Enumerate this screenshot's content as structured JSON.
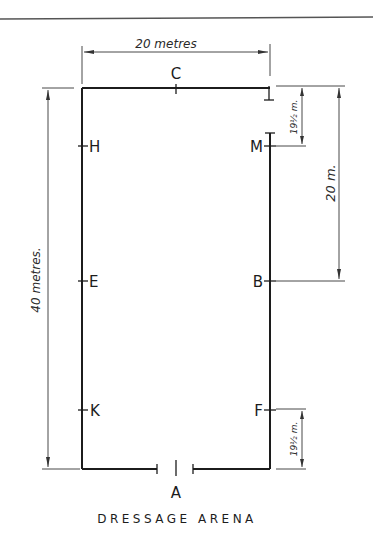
{
  "diagram": {
    "title": "DRESSAGE ARENA",
    "markers": {
      "top": "C",
      "bottom": "A",
      "left": [
        "H",
        "E",
        "K"
      ],
      "right": [
        "M",
        "B",
        "F"
      ]
    },
    "dimensions": {
      "width": "20 metres",
      "length": "40 metres.",
      "half_length": "20 m.",
      "corner_top": "19½ m.",
      "corner_bottom": "19½ m."
    },
    "colors": {
      "ink": "#1c1c1c",
      "paper": "#ffffff"
    }
  }
}
